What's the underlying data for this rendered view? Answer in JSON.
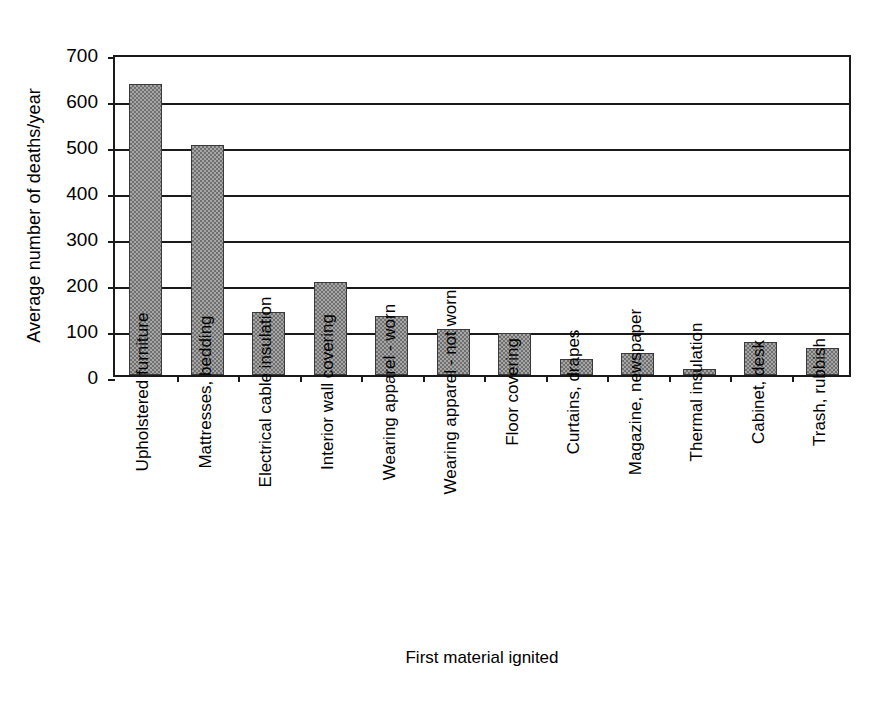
{
  "chart_data": {
    "type": "bar",
    "title": "",
    "xlabel": "First material ignited",
    "ylabel": "Average number of deaths/year",
    "categories": [
      "Upholstered furniture",
      "Mattresses, bedding",
      "Electrical cable insulation",
      "Interior wall covering",
      "Wearing apparel - worn",
      "Wearing apparel - not worn",
      "Floor covering",
      "Curtains, drapes",
      "Magazine, newspaper",
      "Thermal insulation",
      "Cabinet, desk",
      "Trash, rubbish"
    ],
    "values": [
      633,
      500,
      138,
      203,
      128,
      100,
      92,
      35,
      48,
      14,
      72,
      58
    ],
    "ylim": [
      0,
      700
    ],
    "yticks": [
      0,
      100,
      200,
      300,
      400,
      500,
      600,
      700
    ],
    "ytick_labels": [
      "0",
      "100",
      "200",
      "300",
      "400",
      "500",
      "600",
      "700"
    ],
    "grid": true,
    "grid_axis": "y",
    "legend": false,
    "bar_color": "#8a8a8a",
    "bar_edge_color": "#3a3a3a",
    "axis_color": "#1a1a1a",
    "background_color": "#ffffff"
  }
}
